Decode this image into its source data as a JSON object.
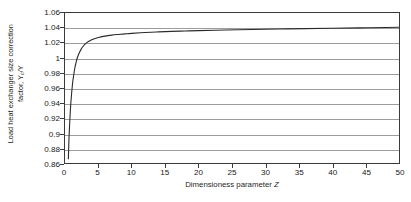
{
  "chart_data": {
    "type": "line",
    "title": "",
    "xlabel": "Dimensioness parameter Z",
    "ylabel_line1": "Load heat exchanger size correction",
    "ylabel_line2": "factor, Y",
    "ylabel_subscript": "c",
    "ylabel_line2_tail": "/Y",
    "xlim": [
      0,
      50
    ],
    "ylim": [
      0.86,
      1.06
    ],
    "xticks": [
      0,
      5,
      10,
      15,
      20,
      25,
      30,
      35,
      40,
      45,
      50
    ],
    "xtick_labels": [
      "0",
      "5",
      "10",
      "15",
      "20",
      "25",
      "30",
      "35",
      "40",
      "45",
      "50"
    ],
    "yticks": [
      0.86,
      0.88,
      0.9,
      0.92,
      0.94,
      0.96,
      0.98,
      1,
      1.02,
      1.04,
      1.06
    ],
    "ytick_labels": [
      "0.86",
      "0.88",
      "0.9",
      "0.92",
      "0.94",
      "0.96",
      "0.98",
      "1",
      "1.02",
      "1.04",
      "1.06"
    ],
    "grid": "horizontal",
    "grid_color": "#9c9c9c",
    "frame_color": "#3a3a3a",
    "legend": "none",
    "series": [
      {
        "name": "Yc/Y",
        "color": "#2b2b2b",
        "line_width": 1.1,
        "x": [
          0.5,
          0.6,
          0.7,
          0.8,
          0.9,
          1.0,
          1.1,
          1.2,
          1.3,
          1.4,
          1.5,
          1.6,
          1.8,
          2.0,
          2.2,
          2.4,
          2.6,
          2.8,
          3.0,
          3.5,
          4.0,
          4.5,
          5.0,
          6.0,
          7.0,
          8.0,
          9.0,
          10.0,
          12.0,
          14.0,
          16.0,
          18.0,
          20.0,
          24.0,
          28.0,
          32.0,
          36.0,
          40.0,
          44.0,
          48.0,
          50.0
        ],
        "y": [
          0.865,
          0.893,
          0.913,
          0.93,
          0.943,
          0.954,
          0.963,
          0.971,
          0.977,
          0.983,
          0.988,
          0.992,
          0.999,
          1.004,
          1.008,
          1.0115,
          1.0143,
          1.0166,
          1.0185,
          1.0219,
          1.0243,
          1.026,
          1.0273,
          1.0292,
          1.0305,
          1.0314,
          1.0322,
          1.0329,
          1.034,
          1.0348,
          1.0355,
          1.036,
          1.0365,
          1.0373,
          1.038,
          1.0386,
          1.0392,
          1.0397,
          1.0402,
          1.0407,
          1.041
        ]
      }
    ]
  }
}
